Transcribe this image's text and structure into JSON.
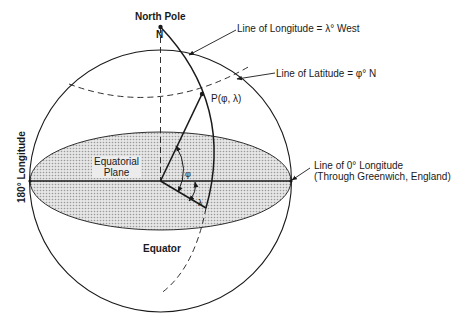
{
  "figure": {
    "north_pole_label": "North Pole",
    "n_label": "N",
    "longitude_line_label": "Line of Longitude = λ° West",
    "latitude_line_label": "Line of Latitude = φ° N",
    "point_label": "P(φ, λ)",
    "equatorial_plane_label_line1": "Equatorial",
    "equatorial_plane_label_line2": "Plane",
    "phi_label": "φ",
    "lambda_label": "λ",
    "prime_meridian_label_line1": "Line of 0° Longitude",
    "prime_meridian_label_line2": "(Through Greenwich, England)",
    "equator_label": "Equator",
    "antimeridian_label": "180° Longitude"
  },
  "colors": {
    "line": "#1a1a1a",
    "plane_fill": "#d4d4d4",
    "background": "#ffffff"
  }
}
